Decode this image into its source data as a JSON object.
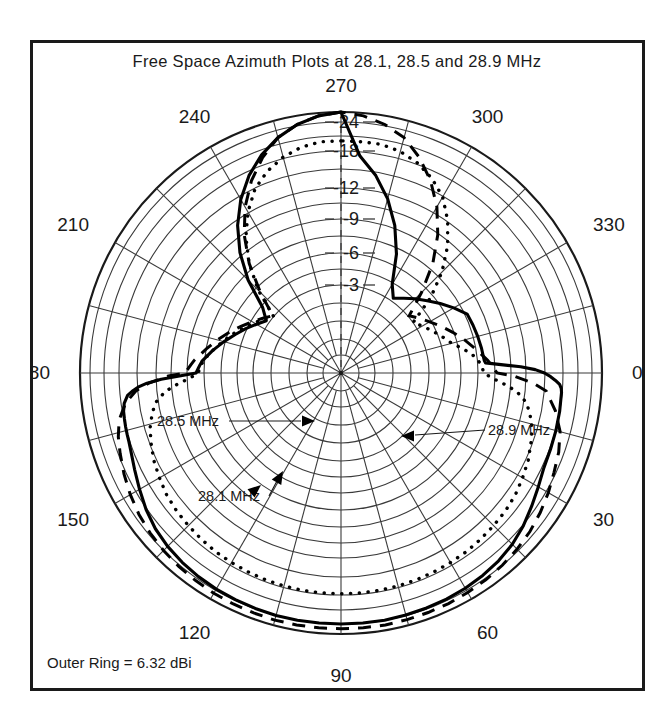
{
  "figure": {
    "title": "Free Space Azimuth Plots at 28.1, 28.5 and 28.9 MHz",
    "footer_note": "Outer Ring = 6.32 dBi"
  },
  "chart_data": {
    "type": "line",
    "plot_style": "polar",
    "title": "Free Space Azimuth Plots at 28.1, 28.5 and 28.9 MHz",
    "xlabel": "Azimuth angle (degrees)",
    "ylabel": "Relative gain (dB)",
    "outer_ring_dbi": 6.32,
    "outer_ring_label": "Outer Ring = 6.32 dBi",
    "grid": true,
    "legend_position": "inline-annotations",
    "angular_tick_labels": [
      "0",
      "30",
      "60",
      "90",
      "120",
      "150",
      "180",
      "210",
      "240",
      "270",
      "300",
      "330"
    ],
    "angular_tick_step_deg": 30,
    "angular_gridline_step_deg": 15,
    "radial_tick_labels": [
      "-3",
      "-6",
      "-9",
      "-12",
      "-18",
      "-24"
    ],
    "radial_tick_values_db": [
      -3,
      -6,
      -9,
      -12,
      -18,
      -24
    ],
    "radial_ring_radii_px": [
      88,
      120,
      154,
      185,
      222,
      251
    ],
    "outer_radius_px": 261,
    "r_max_db": 0,
    "r_min_db": -40,
    "annotations": [
      {
        "text": "28.5 MHz",
        "points_to": "dashed-trace-back-lobe"
      },
      {
        "text": "28.9 MHz",
        "points_to": "dotted-trace-back-lobe"
      },
      {
        "text": "28.1 MHz",
        "points_to": "solid-trace-back-lobe"
      }
    ],
    "series": [
      {
        "name": "28.1 MHz",
        "style": "solid",
        "angles_deg": [
          270,
          265,
          260,
          255,
          250,
          245,
          240,
          235,
          230,
          225,
          220,
          215,
          210,
          205,
          200,
          195,
          190,
          185,
          184,
          183,
          182,
          181,
          180,
          179,
          178,
          177,
          176,
          175,
          174,
          172,
          170,
          168,
          166,
          164,
          162,
          160,
          155,
          150,
          145,
          140,
          135,
          130,
          125,
          120,
          115,
          110,
          105,
          100,
          95,
          90,
          85,
          80,
          75,
          70,
          65,
          60,
          55,
          50,
          45,
          40,
          35,
          30,
          25,
          20,
          15,
          10,
          5,
          4,
          3,
          2,
          1,
          0,
          359,
          358,
          357,
          356,
          355,
          350,
          345,
          340,
          335,
          330,
          325,
          320,
          315,
          310,
          305,
          300,
          295,
          290,
          285,
          280,
          275
        ],
        "values_db": [
          0.0,
          -0.05,
          -0.15,
          -0.3,
          -0.5,
          -0.75,
          -1.05,
          -1.4,
          -1.8,
          -2.25,
          -2.75,
          -3.3,
          -3.9,
          -4.6,
          -5.3,
          -6.1,
          -6.9,
          -7.7,
          -7.8,
          -7.9,
          -8.0,
          -8.1,
          -8.2,
          -9.6,
          -11.5,
          -13.5,
          -15.0,
          -16.0,
          -16.8,
          -17.5,
          -17.8,
          -17.9,
          -18.0,
          -18.1,
          -18.2,
          -18.4,
          -19.2,
          -20.2,
          -21.3,
          -22.2,
          -22.8,
          -23.2,
          -23.5,
          -23.7,
          -23.8,
          -23.9,
          -24.0,
          -24.0,
          -24.0,
          -24.0,
          -24.0,
          -24.0,
          -23.9,
          -23.8,
          -23.7,
          -23.5,
          -23.2,
          -22.8,
          -22.2,
          -21.3,
          -20.2,
          -19.2,
          -18.4,
          -18.2,
          -18.1,
          -18.0,
          -17.9,
          -17.8,
          -17.5,
          -16.8,
          -16.0,
          -15.0,
          -13.5,
          -11.5,
          -9.6,
          -8.2,
          -8.1,
          -8.0,
          -7.9,
          -7.8,
          -7.7,
          -6.9,
          -6.1,
          -5.3,
          -4.6,
          -3.9,
          -3.3,
          -2.75,
          -2.25,
          -1.8,
          -1.4,
          -1.05,
          -0.75,
          -0.5,
          -0.3,
          -0.15,
          -0.05
        ]
      },
      {
        "name": "28.5 MHz",
        "style": "dashed",
        "angles_deg": [
          270,
          265,
          260,
          255,
          250,
          245,
          240,
          235,
          230,
          225,
          220,
          215,
          210,
          205,
          200,
          195,
          190,
          185,
          183,
          181,
          180,
          179,
          177,
          175,
          172,
          168,
          164,
          160,
          155,
          150,
          145,
          140,
          135,
          130,
          125,
          120,
          115,
          110,
          105,
          100,
          95,
          90,
          85,
          80,
          75,
          70,
          65,
          60,
          55,
          50,
          45,
          40,
          35,
          30,
          25,
          20,
          15,
          10,
          5,
          3,
          1,
          0,
          359,
          357,
          355,
          350,
          345,
          340,
          335,
          330,
          325,
          320,
          315,
          310,
          305,
          300,
          295,
          290,
          285,
          280,
          275
        ],
        "values_db": [
          0.0,
          -0.05,
          -0.15,
          -0.3,
          -0.55,
          -0.85,
          -1.2,
          -1.6,
          -2.05,
          -2.55,
          -3.1,
          -3.7,
          -4.35,
          -5.1,
          -5.9,
          -6.7,
          -7.5,
          -8.4,
          -8.7,
          -9.0,
          -9.2,
          -10.8,
          -13.2,
          -15.4,
          -17.3,
          -19.0,
          -20.0,
          -20.7,
          -21.6,
          -22.4,
          -23.1,
          -23.6,
          -24.0,
          -24.3,
          -24.5,
          -24.7,
          -24.8,
          -24.9,
          -25.0,
          -25.0,
          -25.0,
          -25.0,
          -25.0,
          -25.0,
          -24.9,
          -24.8,
          -24.7,
          -24.5,
          -24.3,
          -24.0,
          -23.6,
          -23.1,
          -22.4,
          -21.6,
          -20.7,
          -20.0,
          -19.0,
          -17.3,
          -15.4,
          -13.2,
          -10.8,
          -9.2,
          -9.0,
          -8.7,
          -8.4,
          -7.5,
          -6.7,
          -5.9,
          -5.1,
          -4.35,
          -3.7,
          -3.1,
          -2.55,
          -2.05,
          -1.6,
          -1.2,
          -0.85,
          -0.55,
          -0.3,
          -0.15,
          -0.05
        ]
      },
      {
        "name": "28.9 MHz",
        "style": "dotted",
        "angles_deg": [
          270,
          265,
          260,
          255,
          250,
          245,
          240,
          235,
          230,
          225,
          220,
          215,
          210,
          205,
          200,
          195,
          190,
          186,
          184,
          182,
          180,
          178,
          176,
          174,
          171,
          168,
          164,
          160,
          155,
          150,
          145,
          140,
          135,
          130,
          125,
          120,
          115,
          110,
          105,
          100,
          95,
          90,
          85,
          80,
          75,
          70,
          65,
          60,
          55,
          50,
          45,
          40,
          35,
          30,
          25,
          20,
          16,
          12,
          9,
          6,
          4,
          2,
          0,
          358,
          356,
          354,
          351,
          348,
          345,
          340,
          335,
          330,
          325,
          320,
          315,
          310,
          305,
          300,
          295,
          290,
          285,
          280,
          275
        ],
        "values_db": [
          -0.5,
          -0.5,
          -0.55,
          -0.65,
          -0.8,
          -1.0,
          -1.3,
          -1.65,
          -2.05,
          -2.5,
          -3.0,
          -3.55,
          -4.15,
          -4.8,
          -5.5,
          -6.2,
          -6.9,
          -7.5,
          -7.7,
          -7.9,
          -8.0,
          -8.8,
          -10.0,
          -11.2,
          -12.4,
          -13.3,
          -14.2,
          -14.8,
          -15.5,
          -16.0,
          -16.5,
          -16.8,
          -17.0,
          -17.2,
          -17.4,
          -17.5,
          -17.6,
          -17.7,
          -17.75,
          -17.8,
          -17.8,
          -17.8,
          -17.8,
          -17.8,
          -17.75,
          -17.7,
          -17.6,
          -17.5,
          -17.4,
          -17.2,
          -17.0,
          -16.8,
          -16.5,
          -16.0,
          -15.5,
          -14.8,
          -14.2,
          -13.3,
          -12.4,
          -11.2,
          -10.0,
          -8.8,
          -8.0,
          -7.9,
          -7.7,
          -7.5,
          -6.9,
          -6.2,
          -5.5,
          -4.8,
          -4.15,
          -3.55,
          -3.0,
          -2.5,
          -2.05,
          -1.65,
          -1.3,
          -1.0,
          -0.8,
          -0.65,
          -0.55,
          -0.5,
          -0.5
        ]
      }
    ]
  }
}
